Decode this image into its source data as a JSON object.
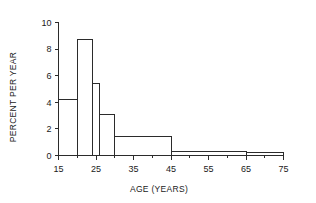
{
  "chart_data": {
    "type": "bar",
    "title": "",
    "subtitle": "",
    "xlabel": "AGE (YEARS)",
    "ylabel": "PERCENT PER YEAR",
    "xlim": [
      15,
      75
    ],
    "ylim": [
      0,
      10
    ],
    "grid": false,
    "legend": null,
    "x_tick_labels": [
      "15",
      "25",
      "35",
      "45",
      "55",
      "65",
      "75"
    ],
    "x_ticks": [
      15,
      25,
      35,
      45,
      55,
      65,
      75
    ],
    "x_minor_ticks": [
      20,
      30,
      40,
      50,
      60,
      70
    ],
    "y_tick_labels": [
      "0",
      "2",
      "4",
      "6",
      "8",
      "10"
    ],
    "y_ticks": [
      0,
      2,
      4,
      6,
      8,
      10
    ],
    "bin_edges": [
      15,
      20,
      24,
      26,
      30,
      45,
      65,
      75
    ],
    "values": [
      4.2,
      8.7,
      5.4,
      3.1,
      1.4,
      0.3,
      0.2
    ],
    "categories": [
      "15-20",
      "20-24",
      "24-26",
      "26-30",
      "30-45",
      "45-65",
      "65-75"
    ],
    "bar_fill": "#ffffff",
    "bar_stroke": "#2b2b2b",
    "axis_color": "#2b2b2b",
    "background": "#ffffff"
  }
}
